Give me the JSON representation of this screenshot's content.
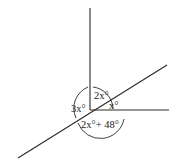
{
  "diagram": {
    "type": "angle-diagram",
    "labels": {
      "left_angle": "3x°",
      "top_angle": "2x°",
      "right_angle": "x°",
      "bottom_angle": "2x°+ 48°"
    },
    "lines": [
      {
        "name": "vertical-ray",
        "from": [
          90,
          110
        ],
        "to": [
          90,
          8
        ]
      },
      {
        "name": "horizontal-ray",
        "from": [
          90,
          110
        ],
        "to": [
          169,
          110
        ]
      },
      {
        "name": "diagonal-line",
        "from": [
          18,
          158
        ],
        "to": [
          167,
          65
        ]
      }
    ]
  }
}
